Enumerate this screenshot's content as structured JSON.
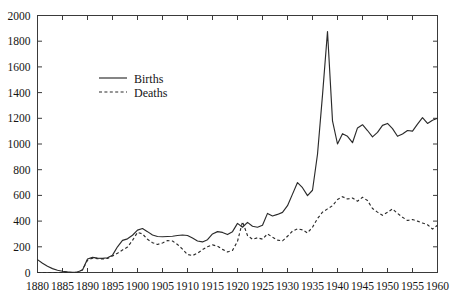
{
  "chart_data": {
    "type": "line",
    "title": "",
    "xlabel": "",
    "ylabel": "",
    "xlim": [
      1880,
      1960
    ],
    "ylim": [
      0,
      2000
    ],
    "grid": false,
    "legend_position": "upper-left-inside",
    "x_ticks": [
      1880,
      1885,
      1890,
      1895,
      1900,
      1905,
      1910,
      1915,
      1920,
      1925,
      1930,
      1935,
      1940,
      1945,
      1950,
      1955,
      1960
    ],
    "y_ticks": [
      0,
      200,
      400,
      600,
      800,
      1000,
      1200,
      1400,
      1600,
      1800,
      2000
    ],
    "x_tick_labels": [
      "1880",
      "1885",
      "1890",
      "1895",
      "1900",
      "1905",
      "1910",
      "1915",
      "1920",
      "1925",
      "1930",
      "1935",
      "1940",
      "1945",
      "1950",
      "1955",
      "1960"
    ],
    "y_tick_labels": [
      "0",
      "200",
      "400",
      "600",
      "800",
      "1000",
      "1200",
      "1400",
      "1600",
      "1800",
      "2000"
    ],
    "x": [
      1880,
      1881,
      1882,
      1883,
      1884,
      1885,
      1886,
      1887,
      1888,
      1889,
      1890,
      1891,
      1892,
      1893,
      1894,
      1895,
      1896,
      1897,
      1898,
      1899,
      1900,
      1901,
      1902,
      1903,
      1904,
      1905,
      1906,
      1907,
      1908,
      1909,
      1910,
      1911,
      1912,
      1913,
      1914,
      1915,
      1916,
      1917,
      1918,
      1919,
      1920,
      1921,
      1922,
      1923,
      1924,
      1925,
      1926,
      1927,
      1928,
      1929,
      1930,
      1931,
      1932,
      1933,
      1934,
      1935,
      1936,
      1937,
      1938,
      1939,
      1940,
      1941,
      1942,
      1943,
      1944,
      1945,
      1946,
      1947,
      1948,
      1949,
      1950,
      1951,
      1952,
      1953,
      1954,
      1955,
      1956,
      1957,
      1958,
      1959,
      1960
    ],
    "series": [
      {
        "name": "Births",
        "style": "solid",
        "values": [
          100,
          72,
          48,
          30,
          18,
          10,
          5,
          2,
          4,
          20,
          105,
          118,
          112,
          110,
          115,
          135,
          200,
          250,
          262,
          290,
          330,
          342,
          318,
          292,
          280,
          278,
          280,
          282,
          288,
          292,
          288,
          268,
          245,
          238,
          255,
          300,
          318,
          312,
          295,
          318,
          382,
          352,
          390,
          360,
          352,
          368,
          460,
          440,
          452,
          468,
          520,
          610,
          700,
          660,
          598,
          640,
          920,
          1380,
          1875,
          1180,
          1000,
          1080,
          1060,
          1010,
          1125,
          1150,
          1105,
          1055,
          1090,
          1145,
          1160,
          1120,
          1060,
          1078,
          1105,
          1100,
          1155,
          1205,
          1160,
          1185,
          1200
        ]
      },
      {
        "name": "Deaths",
        "style": "dashed",
        "values": [
          0,
          0,
          0,
          0,
          0,
          0,
          0,
          0,
          2,
          22,
          95,
          112,
          108,
          105,
          110,
          128,
          150,
          175,
          198,
          250,
          312,
          300,
          258,
          232,
          218,
          230,
          248,
          245,
          218,
          182,
          140,
          132,
          150,
          178,
          200,
          215,
          205,
          180,
          160,
          172,
          242,
          395,
          288,
          258,
          270,
          260,
          300,
          275,
          252,
          246,
          282,
          322,
          340,
          332,
          308,
          352,
          420,
          470,
          495,
          520,
          568,
          590,
          572,
          580,
          555,
          585,
          560,
          498,
          470,
          445,
          468,
          495,
          460,
          430,
          405,
          412,
          400,
          385,
          372,
          338,
          368
        ]
      }
    ],
    "legend": [
      {
        "label": "Births",
        "style": "solid"
      },
      {
        "label": "Deaths",
        "style": "dashed"
      }
    ]
  }
}
